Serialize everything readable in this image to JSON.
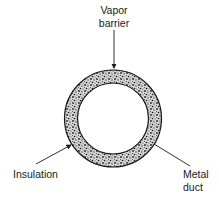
{
  "diagram": {
    "type": "cross-section of insulated duct",
    "labels": {
      "vapor_barrier_line1": "Vapor",
      "vapor_barrier_line2": "barrier",
      "insulation": "Insulation",
      "metal_duct_line1": "Metal",
      "metal_duct_line2": "duct"
    },
    "colors": {
      "ink": "#1a1a1a",
      "background": "#ffffff",
      "insulation_fill": "#8a8a8a"
    }
  }
}
